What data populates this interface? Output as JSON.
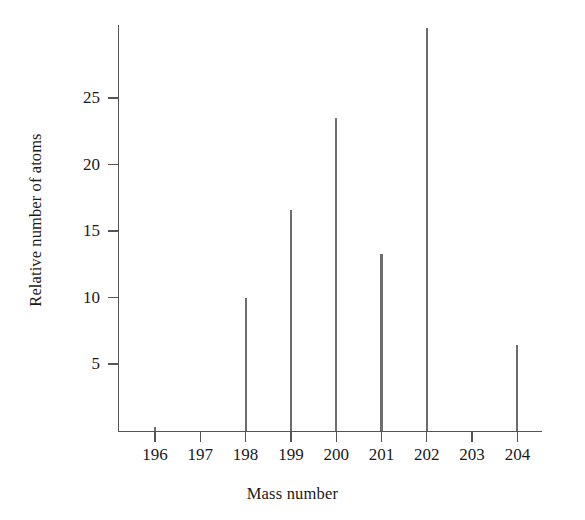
{
  "chart_data": {
    "type": "bar",
    "title": "",
    "subtitle": "",
    "xlabel": "Mass number",
    "ylabel": "Relative number of atoms",
    "categories": [
      196,
      197,
      198,
      199,
      200,
      201,
      202,
      203,
      204
    ],
    "values": [
      0.3,
      0,
      10.0,
      16.6,
      23.5,
      13.3,
      30.3,
      0,
      6.4
    ],
    "x_tick_labels": [
      "196",
      "197",
      "198",
      "199",
      "200",
      "201",
      "202",
      "203",
      "204"
    ],
    "y_tick_labels": [
      "5",
      "10",
      "15",
      "20",
      "25"
    ],
    "y_tick_values": [
      5,
      10,
      15,
      20,
      25
    ],
    "xlim": [
      195.4,
      204.9
    ],
    "ylim": [
      0,
      30.6
    ],
    "grid": false,
    "legend": null,
    "series": [
      {
        "name": "Relative number of atoms",
        "values": [
          0.3,
          0,
          10.0,
          16.6,
          23.5,
          13.3,
          30.3,
          0,
          6.4
        ]
      }
    ],
    "annotations": [],
    "colors": {
      "stick": "#6d6d6d",
      "axis": "#555555",
      "text": "#1a1a1a",
      "background": "#ffffff"
    }
  }
}
